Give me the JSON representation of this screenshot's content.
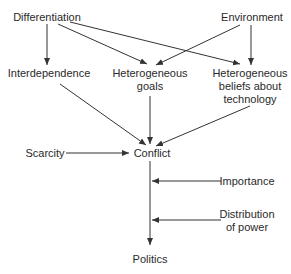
{
  "diagram": {
    "colors": {
      "line": "#333333",
      "text": "#2a2a2a",
      "background": "#ffffff"
    },
    "nodes": {
      "differentiation": "Differentiation",
      "environment": "Environment",
      "interdependence": "Interdependence",
      "heterogeneous_goals_1": "Heterogeneous",
      "heterogeneous_goals_2": "goals",
      "heterogeneous_beliefs_1": "Heterogeneous",
      "heterogeneous_beliefs_2": "beliefs about",
      "heterogeneous_beliefs_3": "technology",
      "scarcity": "Scarcity",
      "conflict": "Conflict",
      "importance": "Importance",
      "distribution_1": "Distribution",
      "distribution_2": "of power",
      "politics": "Politics"
    },
    "edges": [
      {
        "from": "Differentiation",
        "to": "Interdependence"
      },
      {
        "from": "Differentiation",
        "to": "Heterogeneous goals"
      },
      {
        "from": "Differentiation",
        "to": "Heterogeneous beliefs about technology"
      },
      {
        "from": "Environment",
        "to": "Heterogeneous goals"
      },
      {
        "from": "Environment",
        "to": "Heterogeneous beliefs about technology"
      },
      {
        "from": "Interdependence",
        "to": "Conflict"
      },
      {
        "from": "Heterogeneous goals",
        "to": "Conflict"
      },
      {
        "from": "Heterogeneous beliefs about technology",
        "to": "Conflict"
      },
      {
        "from": "Scarcity",
        "to": "Conflict"
      },
      {
        "from": "Conflict",
        "to": "Politics"
      },
      {
        "from": "Importance",
        "to": "Conflict-Politics link"
      },
      {
        "from": "Distribution of power",
        "to": "Conflict-Politics link"
      }
    ]
  }
}
